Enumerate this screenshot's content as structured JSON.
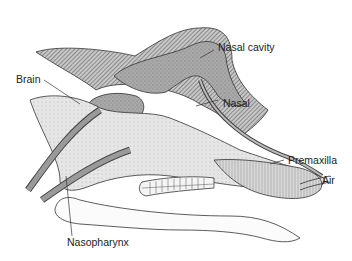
{
  "diagram": {
    "labels": [
      {
        "id": "nasal_cavity",
        "text": "Nasal cavity"
      },
      {
        "id": "brain",
        "text": "Brain"
      },
      {
        "id": "nasal",
        "text": "Nasal"
      },
      {
        "id": "premaxilla",
        "text": "Premaxilla"
      },
      {
        "id": "air",
        "text": "Air"
      },
      {
        "id": "nasopharynx",
        "text": "Nasopharynx"
      }
    ],
    "colors": {
      "outline": "#333333",
      "hatch": "#555555",
      "stipple": "#999999",
      "background": "#ffffff"
    }
  }
}
